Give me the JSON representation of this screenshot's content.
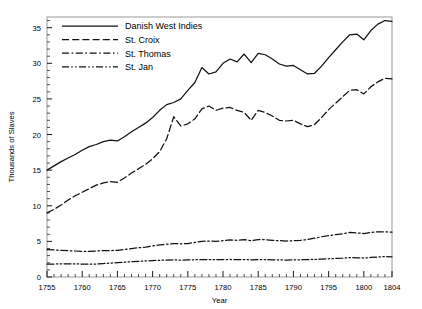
{
  "chart_data": {
    "type": "line",
    "title": "",
    "xlabel": "Year",
    "ylabel": "Thousands of Slaves",
    "xlim": [
      1755,
      1804
    ],
    "ylim": [
      0,
      36.5
    ],
    "yticks": [
      0,
      5,
      10,
      15,
      20,
      25,
      30,
      35
    ],
    "xticks": [
      1755,
      1760,
      1765,
      1770,
      1775,
      1780,
      1785,
      1790,
      1795,
      1800,
      1804
    ],
    "xtick_labels": [
      "1755",
      "1760",
      "1765",
      "1770",
      "1775",
      "1780",
      "1785",
      "1790",
      "1795",
      "1800",
      "1804"
    ],
    "ytick_labels": [
      "0",
      "5",
      "10",
      "15",
      "20",
      "25",
      "30",
      "35"
    ],
    "minor_xticks_every": 1,
    "grid": false,
    "legend_position": "top-left",
    "x": [
      1755,
      1756,
      1757,
      1758,
      1759,
      1760,
      1761,
      1762,
      1763,
      1764,
      1765,
      1766,
      1767,
      1768,
      1769,
      1770,
      1771,
      1772,
      1773,
      1774,
      1775,
      1776,
      1777,
      1778,
      1779,
      1780,
      1781,
      1782,
      1783,
      1784,
      1785,
      1786,
      1787,
      1788,
      1789,
      1790,
      1791,
      1792,
      1793,
      1794,
      1795,
      1796,
      1797,
      1798,
      1799,
      1800,
      1801,
      1802,
      1803,
      1804
    ],
    "series": [
      {
        "name": "Danish West Indies",
        "dash": "solid",
        "values": [
          15.0,
          15.6,
          16.2,
          16.7,
          17.2,
          17.8,
          18.3,
          18.6,
          19.0,
          19.2,
          19.1,
          19.7,
          20.4,
          21.0,
          21.6,
          22.4,
          23.4,
          24.2,
          24.5,
          25.0,
          26.2,
          27.3,
          29.4,
          28.5,
          28.8,
          30.0,
          30.6,
          30.2,
          31.3,
          30.1,
          31.4,
          31.2,
          30.6,
          29.9,
          29.6,
          29.7,
          29.1,
          28.5,
          28.6,
          29.6,
          30.8,
          31.9,
          33.0,
          34.0,
          34.1,
          33.3,
          34.6,
          35.5,
          36.0,
          35.9
        ]
      },
      {
        "name": "St. Croix",
        "dash": "dashed",
        "values": [
          9.0,
          9.5,
          10.1,
          10.8,
          11.4,
          11.9,
          12.4,
          12.9,
          13.2,
          13.4,
          13.3,
          13.9,
          14.6,
          15.2,
          15.8,
          16.6,
          17.6,
          19.4,
          22.5,
          21.2,
          21.5,
          22.2,
          23.6,
          24.0,
          23.4,
          23.7,
          23.8,
          23.4,
          23.1,
          22.0,
          23.4,
          23.1,
          22.6,
          22.0,
          21.9,
          22.0,
          21.5,
          21.1,
          21.4,
          22.4,
          23.5,
          24.4,
          25.3,
          26.2,
          26.3,
          25.7,
          26.7,
          27.4,
          27.9,
          27.8
        ]
      },
      {
        "name": "St. Thomas",
        "dash": "dashdot",
        "values": [
          3.85,
          3.8,
          3.75,
          3.7,
          3.65,
          3.6,
          3.6,
          3.65,
          3.7,
          3.7,
          3.75,
          3.85,
          4.0,
          4.1,
          4.2,
          4.35,
          4.5,
          4.6,
          4.7,
          4.65,
          4.7,
          4.85,
          5.0,
          5.05,
          5.0,
          5.1,
          5.2,
          5.15,
          5.25,
          5.1,
          5.25,
          5.25,
          5.15,
          5.1,
          5.05,
          5.1,
          5.15,
          5.25,
          5.45,
          5.65,
          5.8,
          5.95,
          6.05,
          6.25,
          6.2,
          6.1,
          6.25,
          6.35,
          6.35,
          6.3
        ]
      },
      {
        "name": "St. Jan",
        "dash": "dashdotdot",
        "values": [
          1.8,
          1.82,
          1.85,
          1.86,
          1.84,
          1.82,
          1.8,
          1.82,
          1.88,
          1.95,
          2.02,
          2.08,
          2.15,
          2.2,
          2.25,
          2.3,
          2.35,
          2.38,
          2.4,
          2.38,
          2.4,
          2.42,
          2.45,
          2.44,
          2.42,
          2.44,
          2.46,
          2.44,
          2.45,
          2.42,
          2.44,
          2.44,
          2.42,
          2.4,
          2.38,
          2.4,
          2.42,
          2.44,
          2.48,
          2.52,
          2.56,
          2.6,
          2.64,
          2.72,
          2.7,
          2.66,
          2.74,
          2.82,
          2.86,
          2.84
        ]
      }
    ]
  },
  "legend": {
    "items": [
      {
        "label": "Danish West Indies"
      },
      {
        "label": "St. Croix"
      },
      {
        "label": "St. Thomas"
      },
      {
        "label": "St. Jan"
      }
    ]
  }
}
